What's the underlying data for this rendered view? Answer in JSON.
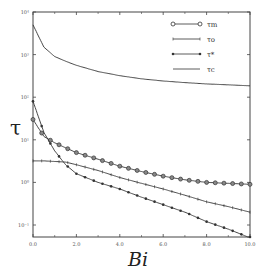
{
  "chart_data": {
    "type": "line",
    "title": "",
    "xlabel": "Bi",
    "ylabel": "τ",
    "xlim": [
      0,
      10
    ],
    "ylim": [
      0.1,
      10000
    ],
    "yscale": "log",
    "grid": false,
    "legend_position": "upper right",
    "x_ticks": [
      "0.0",
      "2.0",
      "4.0",
      "6.0",
      "8.0",
      "10.0"
    ],
    "y_ticks": [
      "10⁴",
      "10³",
      "10²",
      "10¹",
      "10⁰",
      "10⁻¹"
    ],
    "x": [
      0,
      0.5,
      1,
      1.5,
      2,
      3,
      4,
      5,
      6,
      7,
      8,
      9,
      10
    ],
    "series": [
      {
        "name": "τm",
        "marker": "circle",
        "values": [
          30,
          12,
          8.5,
          6.5,
          5.0,
          3.5,
          2.4,
          1.8,
          1.4,
          1.15,
          1.0,
          0.95,
          0.9
        ]
      },
      {
        "name": "τo",
        "marker": "plus",
        "values": [
          3.2,
          3.2,
          3.1,
          3.0,
          2.6,
          1.9,
          1.3,
          0.95,
          0.7,
          0.5,
          0.35,
          0.27,
          0.2
        ]
      },
      {
        "name": "τ*",
        "marker": "star",
        "values": [
          80,
          15,
          5.5,
          2.6,
          1.6,
          1.0,
          0.7,
          0.45,
          0.3,
          0.2,
          0.12,
          0.08,
          0.05
        ]
      },
      {
        "name": "τc",
        "marker": "none",
        "values": [
          5000,
          1500,
          900,
          700,
          560,
          400,
          320,
          270,
          240,
          220,
          205,
          195,
          185
        ]
      }
    ]
  },
  "legend": [
    {
      "label": "τm",
      "marker": "circle"
    },
    {
      "label": "τo",
      "marker": "plus"
    },
    {
      "label": "τ*",
      "marker": "star"
    },
    {
      "label": "τc",
      "marker": "none"
    }
  ],
  "axes": {
    "x_title": "Bi",
    "y_title": "τ",
    "x_ticks": [
      "0.0",
      "2.0",
      "4.0",
      "6.0",
      "8.0",
      "10.0"
    ],
    "y_ticks": [
      "10⁴",
      "10³",
      "10²",
      "10¹",
      "10⁰",
      "10⁻¹"
    ]
  },
  "colors": {
    "line": "#333333",
    "axis": "#444444",
    "background": "#ffffff"
  }
}
